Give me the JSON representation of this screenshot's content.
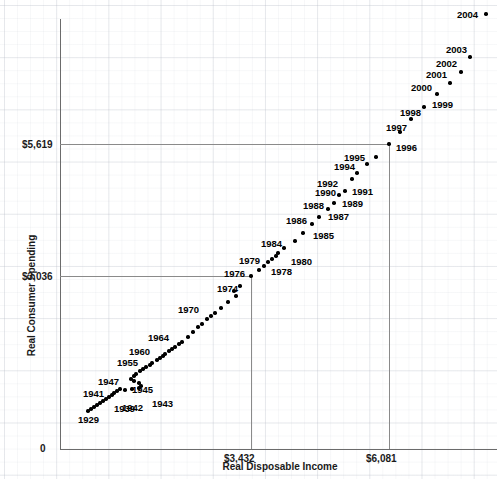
{
  "chart_data": {
    "type": "scatter",
    "title": "",
    "xlabel": "Real Disposable Income",
    "ylabel": "Real Consumer Spending",
    "x_ticks": [
      "0",
      "$3,432",
      "$6,081"
    ],
    "y_ticks": [
      "0",
      "$3,036",
      "$5,619"
    ],
    "xlim": [
      0,
      7600
    ],
    "ylim": [
      0,
      7000
    ],
    "grid": true,
    "legend": "none",
    "reference_lines": [
      {
        "name": "1976-crosshair",
        "x": 3432,
        "y": 3036
      },
      {
        "name": "1996-crosshair",
        "x": 6081,
        "y": 5619
      }
    ],
    "point_labels_shown": [
      "1929",
      "1939",
      "1941",
      "1942",
      "1943",
      "1945",
      "1947",
      "1955",
      "1960",
      "1964",
      "1970",
      "1974",
      "1976",
      "1978",
      "1979",
      "1980",
      "1984",
      "1985",
      "1986",
      "1987",
      "1988",
      "1989",
      "1990",
      "1991",
      "1992",
      "1994",
      "1995",
      "1996",
      "1997",
      "1998",
      "1999",
      "2000",
      "2001",
      "2002",
      "2003",
      "2004"
    ],
    "points": [
      {
        "label": "1929",
        "px": 88,
        "py": 411,
        "lx": 78,
        "ly": 415,
        "show": true
      },
      {
        "label": "1930",
        "px": 91,
        "py": 409,
        "lx": 0,
        "ly": 0,
        "show": false
      },
      {
        "label": "1931",
        "px": 94,
        "py": 407,
        "lx": 0,
        "ly": 0,
        "show": false
      },
      {
        "label": "1932",
        "px": 97,
        "py": 405,
        "lx": 0,
        "ly": 0,
        "show": false
      },
      {
        "label": "1933",
        "px": 100,
        "py": 403,
        "lx": 0,
        "ly": 0,
        "show": false
      },
      {
        "label": "1934",
        "px": 103,
        "py": 401,
        "lx": 0,
        "ly": 0,
        "show": false
      },
      {
        "label": "1935",
        "px": 106,
        "py": 399,
        "lx": 0,
        "ly": 0,
        "show": false
      },
      {
        "label": "1936",
        "px": 109,
        "py": 397,
        "lx": 0,
        "ly": 0,
        "show": false
      },
      {
        "label": "1937",
        "px": 112,
        "py": 395,
        "lx": 0,
        "ly": 0,
        "show": false
      },
      {
        "label": "1938",
        "px": 114,
        "py": 393,
        "lx": 0,
        "ly": 0,
        "show": false
      },
      {
        "label": "1939",
        "px": 117,
        "py": 391,
        "lx": 114,
        "ly": 404,
        "show": true
      },
      {
        "label": "1940",
        "px": 120,
        "py": 389,
        "lx": 0,
        "ly": 0,
        "show": false
      },
      {
        "label": "1941",
        "px": 125,
        "py": 390,
        "lx": 83,
        "ly": 389,
        "show": true
      },
      {
        "label": "1942",
        "px": 132,
        "py": 389,
        "lx": 122,
        "ly": 403,
        "show": true
      },
      {
        "label": "1943",
        "px": 139,
        "py": 388,
        "lx": 152,
        "ly": 399,
        "show": true
      },
      {
        "label": "1944",
        "px": 141,
        "py": 386,
        "lx": 0,
        "ly": 0,
        "show": false
      },
      {
        "label": "1945",
        "px": 139,
        "py": 383,
        "lx": 132,
        "ly": 385,
        "show": true
      },
      {
        "label": "1946",
        "px": 134,
        "py": 381,
        "lx": 0,
        "ly": 0,
        "show": false
      },
      {
        "label": "1947",
        "px": 131,
        "py": 379,
        "lx": 98,
        "ly": 377,
        "show": true
      },
      {
        "label": "1948",
        "px": 134,
        "py": 376,
        "lx": 0,
        "ly": 0,
        "show": false
      },
      {
        "label": "1949",
        "px": 136,
        "py": 374,
        "lx": 0,
        "ly": 0,
        "show": false
      },
      {
        "label": "1950",
        "px": 140,
        "py": 371,
        "lx": 0,
        "ly": 0,
        "show": false
      },
      {
        "label": "1951",
        "px": 143,
        "py": 369,
        "lx": 0,
        "ly": 0,
        "show": false
      },
      {
        "label": "1952",
        "px": 146,
        "py": 367,
        "lx": 0,
        "ly": 0,
        "show": false
      },
      {
        "label": "1953",
        "px": 150,
        "py": 365,
        "lx": 0,
        "ly": 0,
        "show": false
      },
      {
        "label": "1954",
        "px": 152,
        "py": 363,
        "lx": 0,
        "ly": 0,
        "show": false
      },
      {
        "label": "1955",
        "px": 157,
        "py": 360,
        "lx": 117,
        "ly": 358,
        "show": true
      },
      {
        "label": "1956",
        "px": 160,
        "py": 358,
        "lx": 0,
        "ly": 0,
        "show": false
      },
      {
        "label": "1957",
        "px": 163,
        "py": 356,
        "lx": 0,
        "ly": 0,
        "show": false
      },
      {
        "label": "1958",
        "px": 165,
        "py": 354,
        "lx": 0,
        "ly": 0,
        "show": false
      },
      {
        "label": "1959",
        "px": 169,
        "py": 351,
        "lx": 0,
        "ly": 0,
        "show": false
      },
      {
        "label": "1960",
        "px": 172,
        "py": 349,
        "lx": 129,
        "ly": 347,
        "show": true
      },
      {
        "label": "1961",
        "px": 175,
        "py": 347,
        "lx": 0,
        "ly": 0,
        "show": false
      },
      {
        "label": "1962",
        "px": 179,
        "py": 344,
        "lx": 0,
        "ly": 0,
        "show": false
      },
      {
        "label": "1963",
        "px": 182,
        "py": 342,
        "lx": 0,
        "ly": 0,
        "show": false
      },
      {
        "label": "1964",
        "px": 188,
        "py": 337,
        "lx": 148,
        "ly": 333,
        "show": true
      },
      {
        "label": "1965",
        "px": 193,
        "py": 332,
        "lx": 0,
        "ly": 0,
        "show": false
      },
      {
        "label": "1966",
        "px": 198,
        "py": 327,
        "lx": 0,
        "ly": 0,
        "show": false
      },
      {
        "label": "1967",
        "px": 202,
        "py": 324,
        "lx": 0,
        "ly": 0,
        "show": false
      },
      {
        "label": "1968",
        "px": 207,
        "py": 319,
        "lx": 0,
        "ly": 0,
        "show": false
      },
      {
        "label": "1969",
        "px": 211,
        "py": 316,
        "lx": 0,
        "ly": 0,
        "show": false
      },
      {
        "label": "1970",
        "px": 215,
        "py": 313,
        "lx": 178,
        "ly": 305,
        "show": true
      },
      {
        "label": "1971",
        "px": 221,
        "py": 308,
        "lx": 0,
        "ly": 0,
        "show": false
      },
      {
        "label": "1972",
        "px": 228,
        "py": 302,
        "lx": 0,
        "ly": 0,
        "show": false
      },
      {
        "label": "1973",
        "px": 236,
        "py": 296,
        "lx": 0,
        "ly": 0,
        "show": false
      },
      {
        "label": "1974",
        "px": 234,
        "py": 291,
        "lx": 217,
        "ly": 284,
        "show": true
      },
      {
        "label": "1975",
        "px": 240,
        "py": 286,
        "lx": 0,
        "ly": 0,
        "show": false
      },
      {
        "label": "1976",
        "px": 251,
        "py": 276,
        "lx": 224,
        "ly": 269,
        "show": true
      },
      {
        "label": "1977",
        "px": 259,
        "py": 270,
        "lx": 0,
        "ly": 0,
        "show": false
      },
      {
        "label": "1978",
        "px": 264,
        "py": 266,
        "lx": 271,
        "ly": 267,
        "show": true
      },
      {
        "label": "1979",
        "px": 268,
        "py": 262,
        "lx": 239,
        "ly": 256,
        "show": true
      },
      {
        "label": "1980",
        "px": 272,
        "py": 259,
        "lx": 291,
        "ly": 257,
        "show": true
      },
      {
        "label": "1981",
        "px": 276,
        "py": 256,
        "lx": 0,
        "ly": 0,
        "show": false
      },
      {
        "label": "1982",
        "px": 278,
        "py": 253,
        "lx": 0,
        "ly": 0,
        "show": false
      },
      {
        "label": "1983",
        "px": 284,
        "py": 248,
        "lx": 0,
        "ly": 0,
        "show": false
      },
      {
        "label": "1984",
        "px": 295,
        "py": 241,
        "lx": 261,
        "ly": 239,
        "show": true
      },
      {
        "label": "1985",
        "px": 303,
        "py": 233,
        "lx": 313,
        "ly": 231,
        "show": true
      },
      {
        "label": "1986",
        "px": 312,
        "py": 224,
        "lx": 286,
        "ly": 216,
        "show": true
      },
      {
        "label": "1987",
        "px": 319,
        "py": 217,
        "lx": 328,
        "ly": 212,
        "show": true
      },
      {
        "label": "1988",
        "px": 328,
        "py": 209,
        "lx": 303,
        "ly": 201,
        "show": true
      },
      {
        "label": "1989",
        "px": 334,
        "py": 203,
        "lx": 342,
        "ly": 199,
        "show": true
      },
      {
        "label": "1990",
        "px": 339,
        "py": 195,
        "lx": 315,
        "ly": 188,
        "show": true
      },
      {
        "label": "1991",
        "px": 345,
        "py": 191,
        "lx": 352,
        "ly": 187,
        "show": true
      },
      {
        "label": "1992",
        "px": 352,
        "py": 179,
        "lx": 317,
        "ly": 179,
        "show": true
      },
      {
        "label": "1993",
        "px": 357,
        "py": 173,
        "lx": 0,
        "ly": 0,
        "show": false
      },
      {
        "label": "1994",
        "px": 367,
        "py": 164,
        "lx": 334,
        "ly": 162,
        "show": true
      },
      {
        "label": "1995",
        "px": 376,
        "py": 157,
        "lx": 344,
        "ly": 153,
        "show": true
      },
      {
        "label": "1996",
        "px": 389,
        "py": 144,
        "lx": 396,
        "ly": 143,
        "show": true
      },
      {
        "label": "1997",
        "px": 400,
        "py": 132,
        "lx": 386,
        "ly": 123,
        "show": true
      },
      {
        "label": "1998",
        "px": 411,
        "py": 119,
        "lx": 400,
        "ly": 108,
        "show": true
      },
      {
        "label": "1999",
        "px": 424,
        "py": 107,
        "lx": 432,
        "ly": 100,
        "show": true
      },
      {
        "label": "2000",
        "px": 437,
        "py": 94,
        "lx": 411,
        "ly": 83,
        "show": true
      },
      {
        "label": "2001",
        "px": 450,
        "py": 83,
        "lx": 426,
        "ly": 70,
        "show": true
      },
      {
        "label": "2002",
        "px": 461,
        "py": 72,
        "lx": 436,
        "ly": 59,
        "show": true
      },
      {
        "label": "2003",
        "px": 470,
        "py": 57,
        "lx": 446,
        "ly": 45,
        "show": true
      },
      {
        "label": "2004",
        "px": 486,
        "py": 14,
        "lx": 457,
        "ly": 10,
        "show": true
      }
    ]
  }
}
